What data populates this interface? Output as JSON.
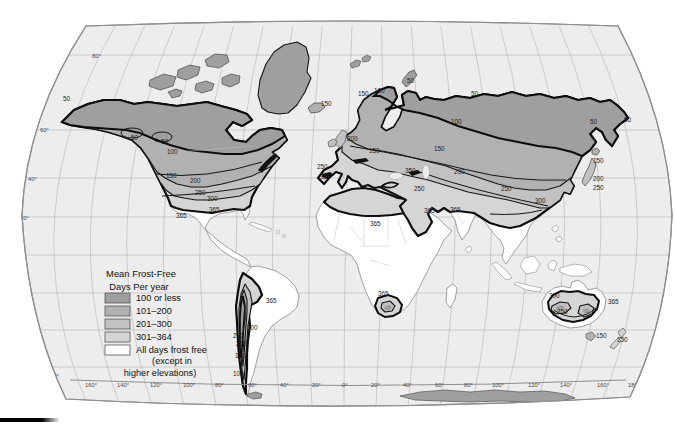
{
  "map": {
    "colors": {
      "ocean": "#ededed",
      "band1": "#9f9f9f",
      "band2": "#b1b1b1",
      "band3": "#c2c2c2",
      "band4": "#d5d5d5",
      "frost_free": "#ffffff"
    },
    "legend": {
      "title_line1": "Mean Frost-Free",
      "title_line2": "Days Per year",
      "items": [
        {
          "label": "100 or less",
          "color": "#9f9f9f"
        },
        {
          "label": "101–200",
          "color": "#b1b1b1"
        },
        {
          "label": "201–300",
          "color": "#c2c2c2"
        },
        {
          "label": "301–364",
          "color": "#d5d5d5"
        },
        {
          "label": "All days frost free",
          "color": "#ffffff"
        }
      ],
      "footnote_line1": "(except in",
      "footnote_line2": "higher elevations)"
    },
    "contour_labels": [
      {
        "t": "50",
        "x": 63,
        "y": 101
      },
      {
        "t": "50",
        "x": 131,
        "y": 140
      },
      {
        "t": "50",
        "x": 161,
        "y": 144
      },
      {
        "t": "100",
        "x": 167,
        "y": 154
      },
      {
        "t": "150",
        "x": 166,
        "y": 178
      },
      {
        "t": "200",
        "x": 190,
        "y": 183
      },
      {
        "t": "250",
        "x": 195,
        "y": 195
      },
      {
        "t": "300",
        "x": 207,
        "y": 201
      },
      {
        "t": "365",
        "x": 209,
        "y": 212
      },
      {
        "t": "365",
        "x": 176,
        "y": 218
      },
      {
        "t": "150",
        "x": 321,
        "y": 106
      },
      {
        "t": "150",
        "x": 358,
        "y": 96
      },
      {
        "t": "100",
        "x": 374,
        "y": 93
      },
      {
        "t": "50",
        "x": 407,
        "y": 83
      },
      {
        "t": "50",
        "x": 471,
        "y": 96
      },
      {
        "t": "100",
        "x": 451,
        "y": 124
      },
      {
        "t": "200",
        "x": 347,
        "y": 141
      },
      {
        "t": "150",
        "x": 369,
        "y": 153
      },
      {
        "t": "150",
        "x": 434,
        "y": 151
      },
      {
        "t": "250",
        "x": 317,
        "y": 169
      },
      {
        "t": "350",
        "x": 320,
        "y": 179
      },
      {
        "t": "200",
        "x": 454,
        "y": 174
      },
      {
        "t": "350",
        "x": 405,
        "y": 173
      },
      {
        "t": "250",
        "x": 414,
        "y": 191
      },
      {
        "t": "365",
        "x": 370,
        "y": 226
      },
      {
        "t": "365",
        "x": 424,
        "y": 213
      },
      {
        "t": "365",
        "x": 450,
        "y": 212
      },
      {
        "t": "250",
        "x": 501,
        "y": 191
      },
      {
        "t": "300",
        "x": 535,
        "y": 203
      },
      {
        "t": "50",
        "x": 590,
        "y": 124
      },
      {
        "t": "50",
        "x": 624,
        "y": 122
      },
      {
        "t": "150",
        "x": 593,
        "y": 163
      },
      {
        "t": "200",
        "x": 593,
        "y": 181
      },
      {
        "t": "250",
        "x": 593,
        "y": 190
      },
      {
        "t": "365",
        "x": 266,
        "y": 303
      },
      {
        "t": "300",
        "x": 247,
        "y": 330
      },
      {
        "t": "250",
        "x": 233,
        "y": 338
      },
      {
        "t": "200",
        "x": 236,
        "y": 346
      },
      {
        "t": "150",
        "x": 235,
        "y": 358
      },
      {
        "t": "100",
        "x": 233,
        "y": 376
      },
      {
        "t": "365",
        "x": 378,
        "y": 296
      },
      {
        "t": "300",
        "x": 549,
        "y": 298
      },
      {
        "t": "350",
        "x": 557,
        "y": 314
      },
      {
        "t": "365",
        "x": 608,
        "y": 304
      },
      {
        "t": "150",
        "x": 596,
        "y": 338
      },
      {
        "t": "250",
        "x": 617,
        "y": 342
      }
    ],
    "longitude_labels": [
      {
        "t": "160°",
        "x": 85,
        "y": 387
      },
      {
        "t": "140°",
        "x": 117,
        "y": 387
      },
      {
        "t": "120°",
        "x": 150,
        "y": 387
      },
      {
        "t": "100°",
        "x": 183,
        "y": 387
      },
      {
        "t": "80°",
        "x": 215,
        "y": 387
      },
      {
        "t": "60°",
        "x": 248,
        "y": 387
      },
      {
        "t": "40°",
        "x": 280,
        "y": 387
      },
      {
        "t": "20°",
        "x": 312,
        "y": 387
      },
      {
        "t": "0°",
        "x": 342,
        "y": 387
      },
      {
        "t": "20°",
        "x": 371,
        "y": 387
      },
      {
        "t": "40°",
        "x": 403,
        "y": 387
      },
      {
        "t": "60°",
        "x": 435,
        "y": 387
      },
      {
        "t": "80°",
        "x": 464,
        "y": 387
      },
      {
        "t": "100°",
        "x": 492,
        "y": 387
      },
      {
        "t": "120°",
        "x": 528,
        "y": 387
      },
      {
        "t": "140°",
        "x": 560,
        "y": 387
      },
      {
        "t": "160°",
        "x": 597,
        "y": 387
      },
      {
        "t": "180°",
        "x": 628,
        "y": 387
      }
    ],
    "latitude_labels": [
      {
        "t": "80°",
        "x": 92,
        "y": 58
      },
      {
        "t": "60°",
        "x": 40,
        "y": 132
      },
      {
        "t": "40°",
        "x": 28,
        "y": 181
      },
      {
        "t": "20°",
        "x": 20,
        "y": 220
      },
      {
        "t": "0°",
        "x": 17,
        "y": 258
      },
      {
        "t": "20°",
        "x": 20,
        "y": 296
      },
      {
        "t": "40°",
        "x": 27,
        "y": 332
      },
      {
        "t": "160°",
        "x": 47,
        "y": 378
      },
      {
        "t": "180°",
        "x": 43,
        "y": 386
      }
    ]
  }
}
